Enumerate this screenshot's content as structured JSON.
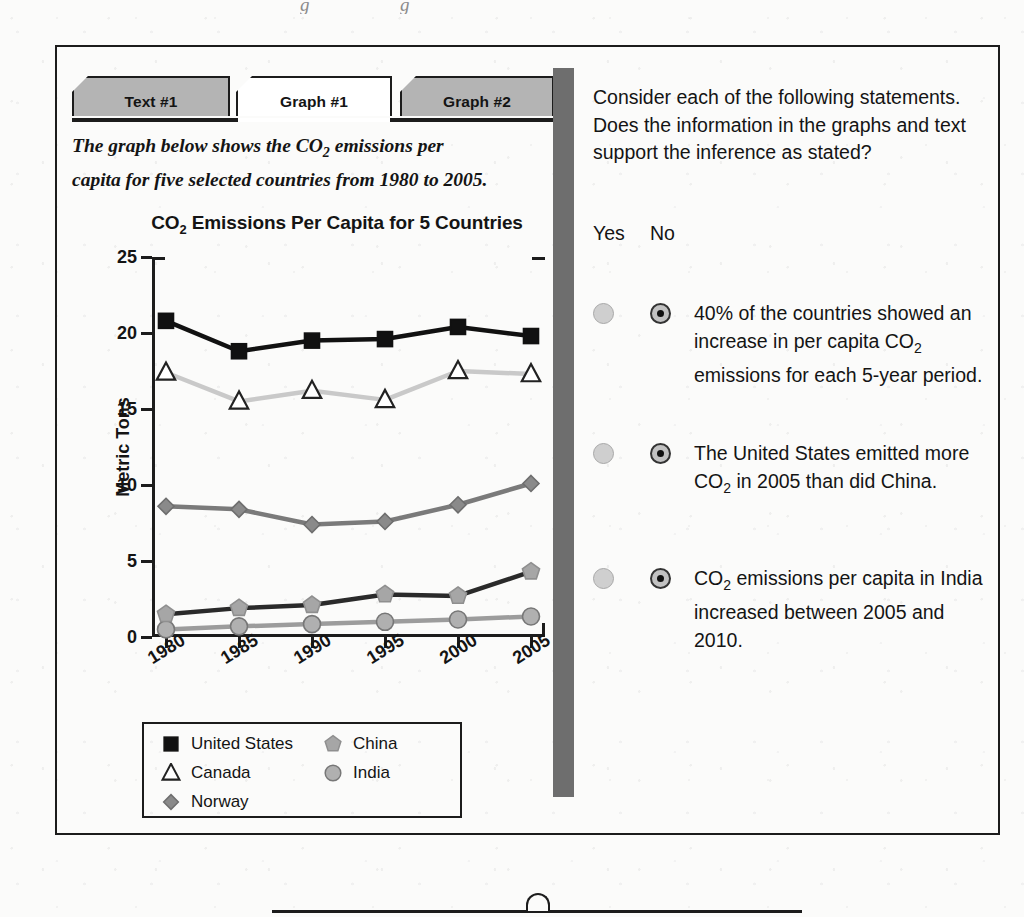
{
  "tabs": [
    {
      "label": "Text #1",
      "active": false
    },
    {
      "label": "Graph #1",
      "active": true
    },
    {
      "label": "Graph #2",
      "active": false
    }
  ],
  "intro": {
    "line1_a": "The graph below shows the CO",
    "line1_sub": "2",
    "line1_b": " emissions per",
    "line2": "capita for five selected countries from 1980 to 2005."
  },
  "chart_data": {
    "type": "line",
    "title_a": "CO",
    "title_sub": "2",
    "title_b": " Emissions Per Capita for 5 Countries",
    "title": "CO2 Emissions Per Capita for 5 Countries",
    "xlabel": "",
    "ylabel": "Metric Tons",
    "categories": [
      "1980",
      "1985",
      "1990",
      "1995",
      "2000",
      "2005"
    ],
    "x": [
      1980,
      1985,
      1990,
      1995,
      2000,
      2005
    ],
    "ylim": [
      0,
      25
    ],
    "yticks": [
      0,
      5,
      10,
      15,
      20,
      25
    ],
    "grid": false,
    "legend_position": "below-plot",
    "series": [
      {
        "name": "United States",
        "marker": "square",
        "marker_fill": "#111111",
        "marker_stroke": "#111111",
        "line_color": "#111111",
        "line_width": 4.5,
        "values": [
          20.8,
          18.8,
          19.5,
          19.6,
          20.4,
          19.8
        ]
      },
      {
        "name": "Canada",
        "marker": "triangle",
        "marker_fill": "#ffffff",
        "marker_stroke": "#222222",
        "line_color": "#c9c9c9",
        "line_width": 4.5,
        "values": [
          17.4,
          15.5,
          16.2,
          15.6,
          17.5,
          17.3
        ]
      },
      {
        "name": "Norway",
        "marker": "diamond",
        "marker_fill": "#8a8a8a",
        "marker_stroke": "#6e6e6e",
        "line_color": "#7a7a7a",
        "line_width": 4.5,
        "values": [
          8.6,
          8.4,
          7.4,
          7.6,
          8.7,
          10.1
        ]
      },
      {
        "name": "China",
        "marker": "pentagon",
        "marker_fill": "#a6a6a6",
        "marker_stroke": "#8f8f8f",
        "line_color": "#2a2a2a",
        "line_width": 4.5,
        "values": [
          1.5,
          1.9,
          2.1,
          2.8,
          2.7,
          4.3
        ]
      },
      {
        "name": "India",
        "marker": "circle",
        "marker_fill": "#b0b0b0",
        "marker_stroke": "#777777",
        "line_color": "#9c9c9c",
        "line_width": 4.5,
        "values": [
          0.5,
          0.7,
          0.85,
          1.0,
          1.15,
          1.35
        ]
      }
    ]
  },
  "legend": {
    "items": [
      {
        "label": "United States",
        "marker": "square",
        "col": 0,
        "row": 0
      },
      {
        "label": "Canada",
        "marker": "triangle",
        "col": 0,
        "row": 1
      },
      {
        "label": "Norway",
        "marker": "diamond",
        "col": 0,
        "row": 2
      },
      {
        "label": "China",
        "marker": "pentagon",
        "col": 1,
        "row": 0
      },
      {
        "label": "India",
        "marker": "circle",
        "col": 1,
        "row": 1
      }
    ]
  },
  "question": {
    "prompt": "Consider each of the following statements. Does the information in the graphs and text support the inference as stated?",
    "yes_label": "Yes",
    "no_label": "No",
    "statements": [
      {
        "parts": [
          {
            "t": "40% of the countries showed an increase in per capita CO"
          },
          {
            "sub": "2"
          },
          {
            "t": " emissions for each 5-year period."
          }
        ],
        "text": "40% of the countries showed an increase in per capita CO2 emissions for each 5-year period.",
        "selected": "no"
      },
      {
        "parts": [
          {
            "t": "The United States emitted more CO"
          },
          {
            "sub": "2"
          },
          {
            "t": " in 2005 than did China."
          }
        ],
        "text": "The United States emitted more CO2 in 2005 than did China.",
        "selected": "no"
      },
      {
        "parts": [
          {
            "t": "CO"
          },
          {
            "sub": "2"
          },
          {
            "t": " emissions per capita in India increased between 2005 and 2010."
          }
        ],
        "text": "CO2 emissions per capita in India increased between 2005 and 2010.",
        "selected": "no"
      }
    ]
  },
  "colors": {
    "ink": "#1c1c1c",
    "tab_inactive": "#b4b4b4",
    "tab_active": "#ffffff",
    "divider": "#6e6e6e",
    "paper": "#fbfbfa"
  },
  "ghost_top": "cut-off text"
}
